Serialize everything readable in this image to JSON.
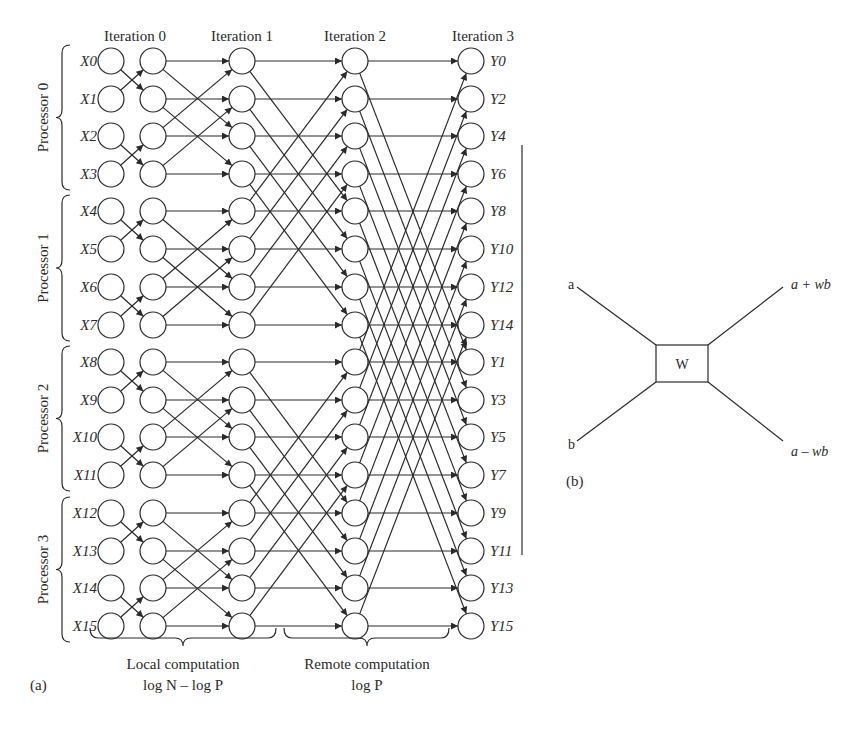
{
  "figure_a": {
    "panel_label": "(a)",
    "iterations": [
      "Iteration 0",
      "Iteration 1",
      "Iteration 2",
      "Iteration 3"
    ],
    "processors": [
      "Processor 0",
      "Processor 1",
      "Processor 2",
      "Processor 3"
    ],
    "inputs": [
      "X0",
      "X1",
      "X2",
      "X3",
      "X4",
      "X5",
      "X6",
      "X7",
      "X8",
      "X9",
      "X10",
      "X11",
      "X12",
      "X13",
      "X14",
      "X15"
    ],
    "outputs": [
      "Y0",
      "Y2",
      "Y4",
      "Y6",
      "Y8",
      "Y10",
      "Y12",
      "Y14",
      "Y1",
      "Y3",
      "Y5",
      "Y7",
      "Y9",
      "Y11",
      "Y13",
      "Y15"
    ],
    "local_label": "Local computation",
    "local_sub": "log N – log P",
    "remote_label": "Remote computation",
    "remote_sub": "log P"
  },
  "figure_b": {
    "panel_label": "(b)",
    "input_a": "a",
    "input_b": "b",
    "box": "W",
    "out_plus": "a + wb",
    "out_minus": "a – wb"
  },
  "colors": {
    "ink": "#2a2a2a",
    "background": "#ffffff"
  }
}
